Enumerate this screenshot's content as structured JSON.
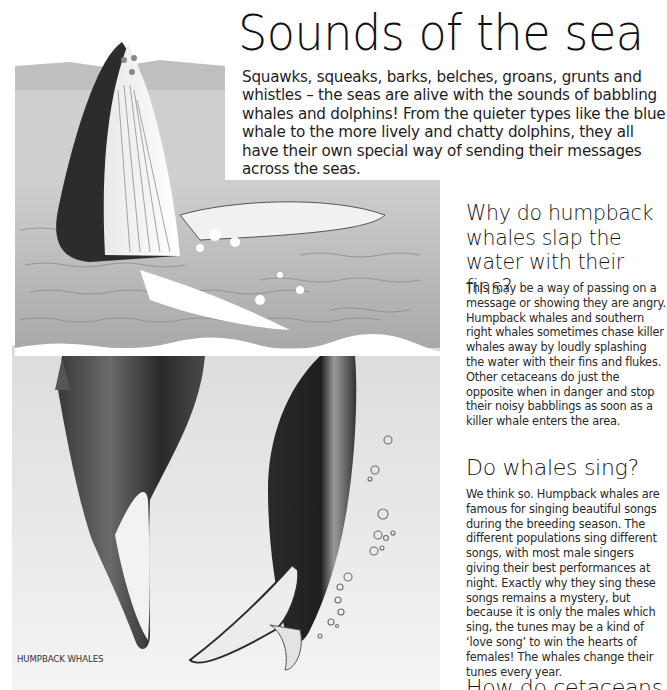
{
  "page": {
    "title": "Sounds of the sea",
    "intro": "Squawks, squeaks, barks, belches, groans, grunts and whistles – the seas are alive with the sounds of babbling whales and dolphins! From the quieter types like the blue whale to the more lively and chatty dolphins, they all have their own special way of sending their messages across the seas."
  },
  "sections": [
    {
      "heading": "Why do humpback whales slap the water with their fins?",
      "body": "This may be a way of passing on a  message or showing they are angry. Humpback whales and southern right whales sometimes chase killer whales away by loudly splashing the water with their fins and flukes. Other cetaceans do just the opposite when in danger and stop their noisy babblings as soon as a killer whale enters the area."
    },
    {
      "heading": "Do whales sing?",
      "body": "We think so. Humpback whales are famous for singing beautiful songs during the breeding season. The different populations sing different songs, with most male singers giving their best performances at night. Exactly why they sing these songs remains a mystery, but because it is only the males which sing, the tunes may be a kind of ‘love song’ to win the hearts of females! The whales change their tunes every year."
    },
    {
      "heading": "How do cetaceans"
    }
  ],
  "illustration": {
    "caption": "HUMPBACK WHALES",
    "subject": "humpback-whales-illustration"
  },
  "colors": {
    "text": "#1a1a1a",
    "water_surface": "#bdbdbd",
    "underwater": "#e6e6e6",
    "whale_dark": "#2b2b2b"
  }
}
